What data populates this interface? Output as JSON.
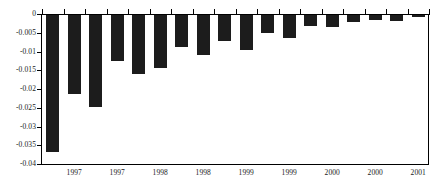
{
  "chart_data": {
    "type": "bar",
    "title": "",
    "subtitle": "",
    "xlabel": "",
    "ylabel": "",
    "grid": false,
    "legend": "none",
    "orientation": "vertical",
    "bar_color": "#1c1c1c",
    "background_color": "#ffffff",
    "axis_color": "#000000",
    "ylim": [
      -0.04,
      0
    ],
    "y_ticks": [
      0,
      -0.005,
      -0.01,
      -0.015,
      -0.02,
      -0.025,
      -0.03,
      -0.035,
      -0.04
    ],
    "y_tick_labels": [
      "0",
      "-0.005",
      "-0.01",
      "-0.015",
      "-0.02",
      "-0.025",
      "-0.03",
      "-0.035",
      "-0.04"
    ],
    "x_tick_labels": [
      "1997",
      "1997",
      "1998",
      "1998",
      "1999",
      "1999",
      "2000",
      "2000",
      "2001"
    ],
    "x_tick_positions": [
      1,
      3,
      5,
      7,
      9,
      11,
      13,
      15,
      17
    ],
    "categories": [
      "1",
      "2",
      "3",
      "4",
      "5",
      "6",
      "7",
      "8",
      "9",
      "10",
      "11",
      "12",
      "13",
      "14",
      "15",
      "16",
      "17",
      "18"
    ],
    "values": [
      -0.0366,
      -0.0211,
      -0.0246,
      -0.0122,
      -0.0157,
      -0.0141,
      -0.0086,
      -0.0107,
      -0.007,
      -0.0094,
      -0.0047,
      -0.0061,
      -0.003,
      -0.0032,
      -0.0019,
      -0.0014,
      -0.0015,
      -0.0004
    ],
    "bar_count": 18
  }
}
